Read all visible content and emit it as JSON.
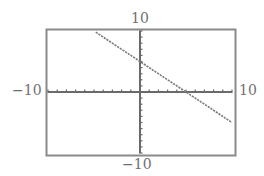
{
  "chart_data": {
    "type": "line",
    "title": "",
    "xlabel": "",
    "ylabel": "",
    "xlim": [
      -10,
      10
    ],
    "ylim": [
      -10,
      10
    ],
    "xscale_ticks": 1,
    "yscale_ticks": 1,
    "grid": false,
    "legend": null,
    "window_labels": {
      "ymax": "10",
      "ymin": "−10",
      "xmin": "−10",
      "xmax": "10"
    },
    "series": [
      {
        "name": "y = -x + 5",
        "equation": "y = -x + 5",
        "slope": -1,
        "intercept": 5,
        "x": [
          -4.8,
          -4,
          -2,
          0,
          2,
          4,
          5,
          6,
          8,
          10
        ],
        "values": [
          9.8,
          9,
          7,
          5,
          3,
          1,
          0,
          -1,
          -3,
          -5
        ]
      }
    ],
    "annotations": []
  },
  "colors": {
    "frame": "#8a8a8a",
    "axes": "#6a6a6a",
    "line": "#7a7a7a",
    "labels": "#707070"
  }
}
